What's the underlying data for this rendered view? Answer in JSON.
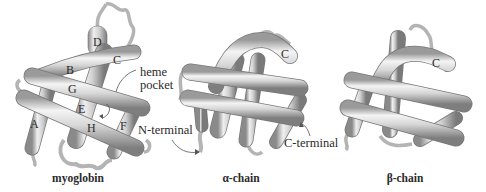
{
  "panels": [
    {
      "id": "myoglobin",
      "caption": "myoglobin",
      "helix_labels": [
        "A",
        "B",
        "C",
        "D",
        "E",
        "F",
        "G",
        "H"
      ],
      "annotations": [
        "heme",
        "pocket"
      ]
    },
    {
      "id": "alpha",
      "caption": "α-chain",
      "helix_labels": [
        "C"
      ],
      "annotations": [
        "N-terminal",
        "C-terminal"
      ]
    },
    {
      "id": "beta",
      "caption": "β-chain",
      "helix_labels": [
        "C"
      ],
      "annotations": []
    }
  ],
  "labels": {
    "A": "A",
    "B": "B",
    "C": "C",
    "D": "D",
    "E": "E",
    "F": "F",
    "G": "G",
    "H": "H",
    "heme": "heme",
    "pocket": "pocket",
    "n_terminal": "N-terminal",
    "c_terminal": "C-terminal",
    "alpha_C": "C",
    "beta_C": "C"
  },
  "captions": {
    "myoglobin": "myoglobin",
    "alpha": "α-chain",
    "beta": "β-chain"
  },
  "colors": {
    "tube_light": "#f2f2f2",
    "tube_mid": "#c8c8c8",
    "tube_dark": "#8e8e8e",
    "outline": "#6a6a6a",
    "text": "#2a2a2a"
  }
}
